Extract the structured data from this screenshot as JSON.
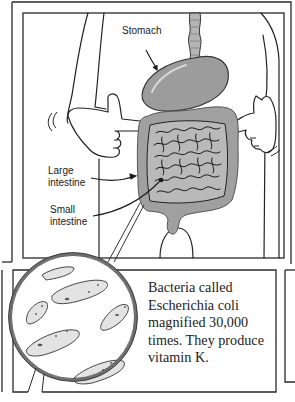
{
  "figure": {
    "top_panel": {
      "labels": {
        "stomach": "Stomach",
        "large_intestine": "Large\nintestine",
        "small_intestine": "Small\nintestine"
      }
    },
    "bottom_panel": {
      "magnifier_subject": "Escherichia coli bacteria",
      "caption": "Bacteria called Escherichia coli magnified 30,000 times. They produce vitamin K."
    }
  },
  "colors": {
    "ink": "#1e1e1e",
    "organ_fill": "#9a9a9a",
    "organ_light": "#bdbdbd",
    "lens_rim": "#7a7a7a",
    "paper": "#ffffff"
  }
}
